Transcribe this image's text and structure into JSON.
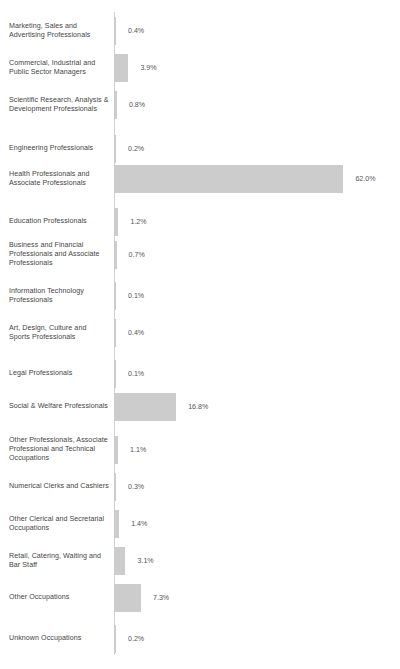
{
  "chart_data": {
    "type": "bar",
    "orientation": "horizontal",
    "title": "",
    "subtitle": "",
    "xlabel": "",
    "ylabel": "",
    "grid": false,
    "legend": null,
    "axis_line": true,
    "value_suffix": "%",
    "xlim": [
      0,
      62.0
    ],
    "bar_color": "#cccccc",
    "label_color": "#444444",
    "value_color": "#555555",
    "categories": [
      "Marketing, Sales and Advertising Professionals",
      "Commercial, Industrial and Public Sector Managers",
      "Scientific Research, Analysis & Development Professionals",
      "Engineering Professionals",
      "Health Professionals and Associate Professionals",
      "Education Professionals",
      "Business and Financial Professionals and Associate Professionals",
      "Information Technology Professionals",
      "Art, Design, Culture and Sports Professionals",
      "Legal Professionals",
      "Social & Welfare Professionals",
      "Other Professionals, Associate Professional and Technical Occupations",
      "Numerical Clerks and Cashiers",
      "Other Clerical and Secretarial Occupations",
      "Retail, Catering, Waiting and Bar Staff",
      "Other Occupations",
      "Unknown Occupations"
    ],
    "values": [
      0.4,
      3.9,
      0.8,
      0.2,
      62.0,
      1.2,
      0.7,
      0.1,
      0.4,
      0.1,
      16.8,
      1.1,
      0.3,
      1.4,
      3.1,
      7.3,
      0.2
    ],
    "value_labels": [
      "0.4%",
      "3.9%",
      "0.8%",
      "0.2%",
      "62.0%",
      "1.2%",
      "0.7%",
      "0.1%",
      "0.4%",
      "0.1%",
      "16.8%",
      "1.1%",
      "0.3%",
      "1.4%",
      "3.1%",
      "7.3%",
      "0.2%"
    ]
  },
  "layout": {
    "axis_x": 114,
    "axis_top": 12,
    "axis_height": 643,
    "px_per_percent": 3.7,
    "row_starts": [
      12,
      49,
      86,
      130,
      160,
      203,
      236,
      277,
      314,
      355,
      388,
      431,
      468,
      505,
      542,
      579,
      620
    ]
  }
}
